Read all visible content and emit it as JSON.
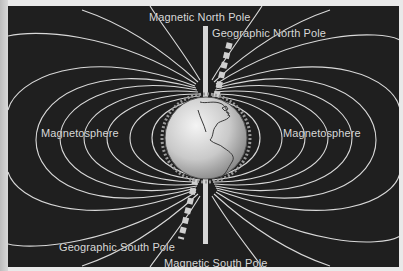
{
  "diagram": {
    "labels": {
      "magnetic_north_pole": "Magnetic North Pole",
      "geographic_north_pole": "Geographic North Pole",
      "magnetosphere_left": "Magnetosphere",
      "magnetosphere_right": "Magnetosphere",
      "geographic_south_pole": "Geographic South Pole",
      "magnetic_south_pole": "Magnetic South Pole"
    },
    "elements": {
      "globe": "Earth globe showing the Americas",
      "magnetic_axis": "vertical solid white bar",
      "geographic_axis": "tilted dashed bar",
      "field_lines": "concentric white dipole field-line loops"
    },
    "colors": {
      "background": "#1f1f1f",
      "field_lines": "#d9d9d9",
      "text": "#d8d8d8",
      "globe": "#cfcfcf"
    }
  }
}
